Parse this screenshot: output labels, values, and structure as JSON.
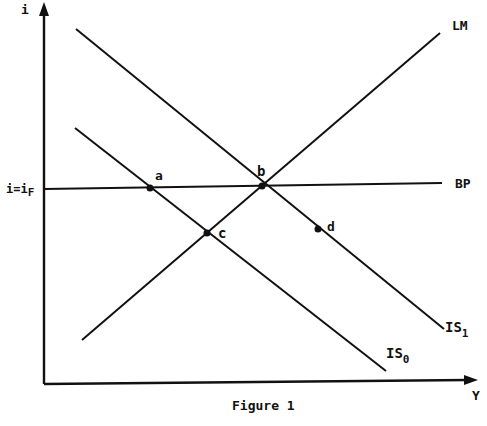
{
  "figure": {
    "caption": "Figure 1",
    "axes": {
      "x_label": "Y",
      "y_label": "i",
      "y_tick_label": "i=i",
      "y_tick_subscript": "F"
    },
    "curves": {
      "lm": {
        "label": "LM"
      },
      "bp": {
        "label": "BP"
      },
      "is0": {
        "label": "IS",
        "subscript": "0"
      },
      "is1": {
        "label": "IS",
        "subscript": "1"
      }
    },
    "points": {
      "a": "a",
      "b": "b",
      "c": "c",
      "d": "d"
    },
    "colors": {
      "ink": "#111111",
      "background": "#ffffff"
    }
  }
}
